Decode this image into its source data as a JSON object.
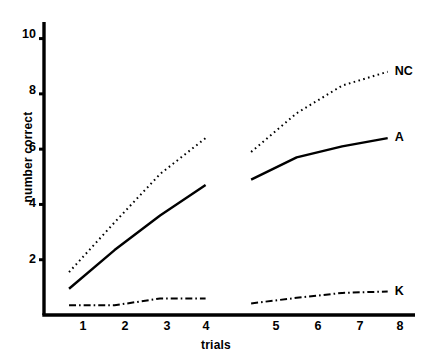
{
  "chart_data": {
    "type": "line",
    "title": "",
    "xlabel": "trials",
    "ylabel": "number correct",
    "xlim": [
      0.45,
      8.6
    ],
    "ylim": [
      0,
      10.6
    ],
    "xticks": [
      1,
      2,
      3,
      4,
      5,
      6,
      7,
      8
    ],
    "xticklabels": [
      "1",
      "2",
      "3",
      "4",
      "5",
      "6",
      "7",
      "8"
    ],
    "yticks": [
      2,
      4,
      6,
      8,
      10
    ],
    "yticklabels": [
      "2",
      "4",
      "6",
      "8",
      "10"
    ],
    "grid": false,
    "legend_position": "inline-right-of-line-ends",
    "note": "Two blocks of trials (1-4 and 5-8) plotted as separate segments with a gap between trial 4 and trial 5.",
    "series": [
      {
        "name": "NC",
        "label": "NC",
        "style": "dotted",
        "color": "#000000",
        "x": [
          1,
          2,
          3,
          4,
          5,
          6,
          7,
          8
        ],
        "values": [
          1.55,
          3.35,
          5.1,
          6.4,
          5.9,
          7.3,
          8.3,
          8.8
        ],
        "segments": [
          [
            1,
            2,
            3,
            4
          ],
          [
            5,
            6,
            7,
            8
          ]
        ],
        "label_position": {
          "x": 8,
          "y": 8.8
        }
      },
      {
        "name": "A",
        "label": "A",
        "style": "solid",
        "color": "#000000",
        "x": [
          1,
          2,
          3,
          4,
          5,
          6,
          7,
          8
        ],
        "values": [
          0.95,
          2.35,
          3.6,
          4.7,
          4.9,
          5.7,
          6.1,
          6.4
        ],
        "segments": [
          [
            1,
            2,
            3,
            4
          ],
          [
            5,
            6,
            7,
            8
          ]
        ],
        "label_position": {
          "x": 8,
          "y": 6.4
        }
      },
      {
        "name": "K",
        "label": "K",
        "style": "dashdot",
        "color": "#000000",
        "x": [
          1,
          2,
          3,
          4,
          5,
          6,
          7,
          8
        ],
        "values": [
          0.35,
          0.35,
          0.6,
          0.6,
          0.42,
          0.62,
          0.8,
          0.85
        ],
        "segments": [
          [
            1,
            2,
            3,
            4
          ],
          [
            5,
            6,
            7,
            8
          ]
        ],
        "label_position": {
          "x": 8,
          "y": 0.85
        }
      }
    ]
  },
  "axes": {
    "y_axis_label": "number correct",
    "x_axis_label": "trials",
    "y_tick_labels": [
      "2",
      "4",
      "6",
      "8",
      "10"
    ],
    "x_tick_labels": [
      "1",
      "2",
      "3",
      "4",
      "5",
      "6",
      "7",
      "8"
    ]
  },
  "series_labels": {
    "nc": "NC",
    "a": "A",
    "k": "K"
  }
}
